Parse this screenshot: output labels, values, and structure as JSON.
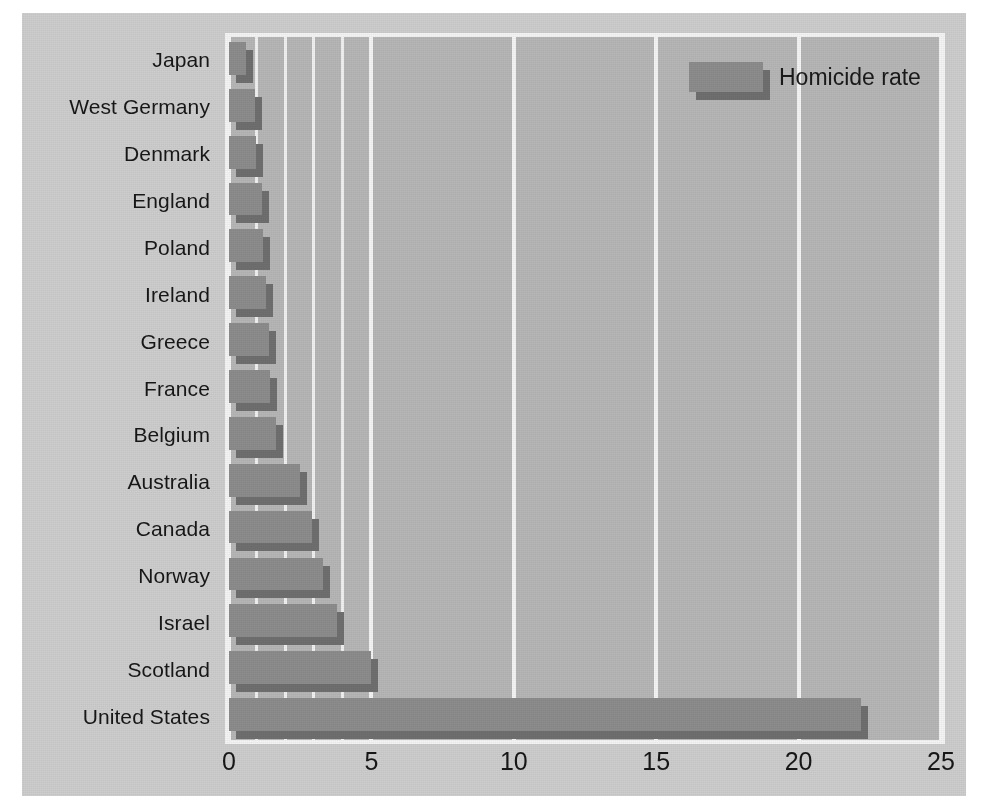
{
  "chart_data": {
    "type": "bar",
    "orientation": "horizontal",
    "title": "",
    "xlabel": "",
    "ylabel": "",
    "xlim": [
      0,
      25
    ],
    "xticks": [
      "0",
      "5",
      "10",
      "15",
      "20",
      "25"
    ],
    "xtick_values": [
      0,
      5,
      10,
      15,
      20,
      25
    ],
    "minor_gridline_step": 1,
    "grid": true,
    "legend_position": "top-right",
    "legend": [
      "Homicide rate"
    ],
    "categories": [
      "Japan",
      "West Germany",
      "Denmark",
      "England",
      "Poland",
      "Ireland",
      "Greece",
      "France",
      "Belgium",
      "Australia",
      "Canada",
      "Norway",
      "Israel",
      "Scotland",
      "United States"
    ],
    "series": [
      {
        "name": "Homicide rate",
        "values": [
          0.6,
          0.9,
          0.95,
          1.15,
          1.2,
          1.3,
          1.4,
          1.45,
          1.65,
          2.5,
          2.9,
          3.3,
          3.8,
          5.0,
          22.2
        ]
      }
    ]
  },
  "legend": {
    "label": "Homicide rate",
    "swatch_color": "#8c8c8c",
    "swatch_shadow_color": "#6f6f6f"
  },
  "colors": {
    "page_background": "#ffffff",
    "canvas_background": "#cdcdcd",
    "plot_background": "#b6b6b6",
    "gridline": "#f4f4f4",
    "bar_face": "#8c8c8c",
    "bar_shadow": "#6f6f6f",
    "text": "#171717"
  }
}
